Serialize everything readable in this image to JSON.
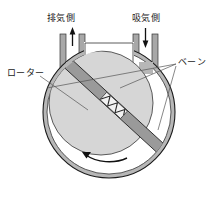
{
  "figure": {
    "labels": {
      "exhaust_side": "排気側",
      "intake_side": "吸気側",
      "rotor": "ローター",
      "vane": "ベーン"
    },
    "arrows": {
      "exhaust_flow_direction": "up",
      "intake_flow_direction": "down",
      "rotation_direction": "counterclockwise"
    },
    "components": [
      "housing-wall",
      "exhaust-pipe",
      "intake-pipe",
      "rotor-disc",
      "sliding-vane",
      "vane-spring",
      "rotation-arrow"
    ],
    "colors": {
      "outline": "#1a1a1a",
      "housing_wall": "#b3b3b3",
      "chamber_fill": "#ffffff",
      "rotor_fill": "#d4d4d4",
      "vane_fill": "#9a9a9a",
      "spring_fill": "#ffffff",
      "pipe_wall": "#a8a8a8",
      "leader_line": "#4d4d4d"
    }
  }
}
